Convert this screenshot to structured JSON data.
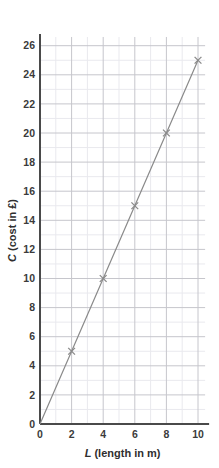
{
  "chart_data": {
    "type": "line",
    "title": "",
    "subtitle": "",
    "xlabel_var": "L",
    "xlabel_rest": " (length in m)",
    "xlabel": "L (length in m)",
    "ylabel_var": "C",
    "ylabel_rest": " (cost in £)",
    "ylabel": "C (cost in £)",
    "x": [
      0,
      2,
      4,
      6,
      8,
      10
    ],
    "values": [
      0,
      5,
      10,
      15,
      20,
      25
    ],
    "series": [
      {
        "name": "Cost vs length",
        "points": [
          {
            "x": 0,
            "y": 0
          },
          {
            "x": 2,
            "y": 5
          },
          {
            "x": 4,
            "y": 10
          },
          {
            "x": 6,
            "y": 15
          },
          {
            "x": 8,
            "y": 20
          },
          {
            "x": 10,
            "y": 25
          }
        ],
        "marker": "cross",
        "marked_points": [
          {
            "x": 2,
            "y": 5
          },
          {
            "x": 4,
            "y": 10
          },
          {
            "x": 6,
            "y": 15
          },
          {
            "x": 8,
            "y": 20
          },
          {
            "x": 10,
            "y": 25
          }
        ],
        "color": "#8a8a8a",
        "slope": 2.5
      }
    ],
    "xlim": [
      0,
      10.45
    ],
    "ylim": [
      0,
      26.6
    ],
    "x_tick_labels": [
      "0",
      "2",
      "4",
      "6",
      "8",
      "10"
    ],
    "x_tick_values": [
      0,
      2,
      4,
      6,
      8,
      10
    ],
    "y_tick_labels": [
      "0",
      "2",
      "4",
      "6",
      "8",
      "10",
      "12",
      "14",
      "16",
      "18",
      "20",
      "22",
      "24",
      "26"
    ],
    "y_tick_values": [
      0,
      2,
      4,
      6,
      8,
      10,
      12,
      14,
      16,
      18,
      20,
      22,
      24,
      26
    ],
    "x_minor_step": 1,
    "y_minor_step": 1,
    "grid": true,
    "grid_major_color": "#c6c6cc",
    "grid_minor_color": "#e9e9ee",
    "axis_color": "#4a4a4a",
    "legend": "none",
    "legend_position": "none",
    "background_color": "#ffffff"
  }
}
